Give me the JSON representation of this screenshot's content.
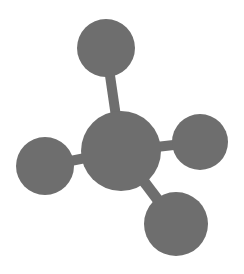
{
  "icon": {
    "name": "molecule-icon",
    "color": "#6e6e6e",
    "background": "#ffffff",
    "atoms": [
      {
        "id": "center",
        "cx": 121,
        "cy": 151,
        "r": 40
      },
      {
        "id": "top",
        "cx": 106,
        "cy": 48,
        "r": 29
      },
      {
        "id": "right",
        "cx": 200,
        "cy": 142,
        "r": 28
      },
      {
        "id": "left",
        "cx": 45,
        "cy": 166,
        "r": 29
      },
      {
        "id": "bottom",
        "cx": 176,
        "cy": 224,
        "r": 32
      }
    ]
  }
}
